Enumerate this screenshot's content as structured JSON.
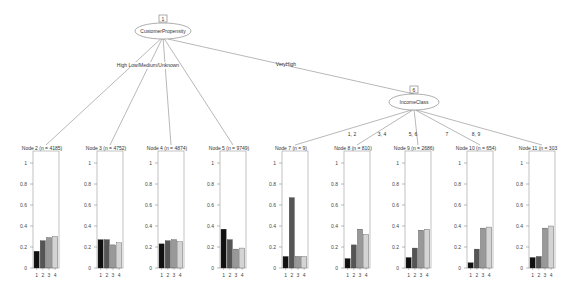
{
  "inner_nodes": [
    {
      "id": "1",
      "variable": "CustomerPropensity",
      "cx": 163,
      "cy": 31,
      "rx": 28,
      "ry": 8
    },
    {
      "id": "6",
      "variable": "IncomeClass",
      "cx": 414,
      "cy": 102,
      "rx": 25,
      "ry": 8
    }
  ],
  "edges": [
    {
      "from": "1",
      "to": "2",
      "label": "High",
      "label_x": 112,
      "label_y": 66
    },
    {
      "from": "1",
      "to": "3",
      "label": "Low",
      "label_x": 137,
      "label_y": 66
    },
    {
      "from": "1",
      "to": "4",
      "label": "Medium",
      "label_x": 155,
      "label_y": 66
    },
    {
      "from": "1",
      "to": "5",
      "label": "Unknown",
      "label_x": 177,
      "label_y": 66
    },
    {
      "from": "1",
      "to": "6",
      "label": "VeryHigh",
      "label_x": 286,
      "label_y": 66
    },
    {
      "from": "6",
      "to": "7",
      "label": "1, 2",
      "label_x": 352,
      "label_y": 136
    },
    {
      "from": "6",
      "to": "8",
      "label": "3, 4",
      "label_x": 382,
      "label_y": 136
    },
    {
      "from": "6",
      "to": "9",
      "label": "5, 6",
      "label_x": 413,
      "label_y": 136
    },
    {
      "from": "6",
      "to": "10",
      "label": "7",
      "label_x": 447,
      "label_y": 136
    },
    {
      "from": "6",
      "to": "11",
      "label": "8, 9",
      "label_x": 476,
      "label_y": 136
    }
  ],
  "edge_label_combined_left": "High  Low/Medium/Unknown",
  "y_ticks": [
    "0",
    "0.2",
    "0.4",
    "0.6",
    "0.8",
    "1"
  ],
  "x_ticks": [
    "1",
    "2",
    "3",
    "4"
  ],
  "chart_data": {
    "type": "bar",
    "categories": [
      "1",
      "2",
      "3",
      "4"
    ],
    "ylim": [
      0,
      1
    ],
    "series": [
      {
        "name": "Node 2 (n = 4185)",
        "values": [
          0.16,
          0.26,
          0.29,
          0.3
        ]
      },
      {
        "name": "Node 3 (n = 4752)",
        "values": [
          0.27,
          0.27,
          0.22,
          0.24
        ]
      },
      {
        "name": "Node 4 (n = 4874)",
        "values": [
          0.23,
          0.26,
          0.27,
          0.25
        ]
      },
      {
        "name": "Node 5 (n = 9749)",
        "values": [
          0.37,
          0.27,
          0.18,
          0.19
        ]
      },
      {
        "name": "Node 7 (n = 9)",
        "values": [
          0.11,
          0.67,
          0.11,
          0.11
        ]
      },
      {
        "name": "Node 8 (n = 810)",
        "values": [
          0.09,
          0.22,
          0.37,
          0.32
        ]
      },
      {
        "name": "Node 9 (n = 2686)",
        "values": [
          0.1,
          0.19,
          0.36,
          0.37
        ]
      },
      {
        "name": "Node 10 (n = 654)",
        "values": [
          0.05,
          0.18,
          0.38,
          0.39
        ]
      },
      {
        "name": "Node 11 (n = 303",
        "values": [
          0.1,
          0.11,
          0.38,
          0.4
        ]
      }
    ]
  },
  "panels": [
    {
      "id": "2",
      "title": "Node 2 (n = 4185)",
      "x": 33
    },
    {
      "id": "3",
      "title": "Node 3 (n = 4752)",
      "x": 97
    },
    {
      "id": "4",
      "title": "Node 4 (n = 4874)",
      "x": 158
    },
    {
      "id": "5",
      "title": "Node 5 (n = 9749)",
      "x": 220
    },
    {
      "id": "7",
      "title": "Node 7 (n = 9)",
      "x": 282
    },
    {
      "id": "8",
      "title": "Node 8 (n = 810)",
      "x": 344
    },
    {
      "id": "9",
      "title": "Node 9 (n = 2686)",
      "x": 405
    },
    {
      "id": "10",
      "title": "Node 10 (n = 654)",
      "x": 467
    },
    {
      "id": "11",
      "title": "Node 11 (n = 303",
      "x": 529
    }
  ],
  "colors": {
    "bar1": "#111111",
    "bar2": "#555555",
    "bar3": "#999999",
    "bar4": "#d4d4d4",
    "line": "#888888",
    "frame": "#999999"
  }
}
